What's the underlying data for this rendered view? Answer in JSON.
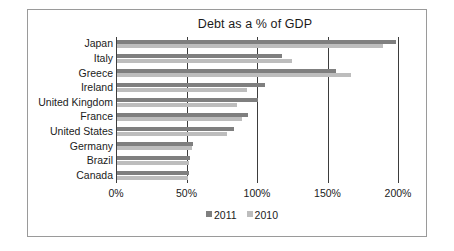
{
  "chart_data": {
    "type": "bar",
    "orientation": "horizontal",
    "title": "Debt as a % of GDP",
    "xlabel": "",
    "ylabel": "",
    "xlim": [
      0,
      200
    ],
    "xticks": [
      0,
      50,
      100,
      150,
      200
    ],
    "xtick_labels": [
      "0%",
      "50%",
      "100%",
      "150%",
      "200%"
    ],
    "grid": true,
    "legend_position": "bottom",
    "categories": [
      "Japan",
      "Italy",
      "Greece",
      "Ireland",
      "United Kingdom",
      "France",
      "United States",
      "Germany",
      "Brazil",
      "Canada"
    ],
    "series": [
      {
        "name": "2011",
        "color": "#7f7f7f",
        "values": [
          198,
          117,
          155,
          105,
          100,
          93,
          83,
          54,
          52,
          51
        ]
      },
      {
        "name": "2010",
        "color": "#bdbdbd",
        "values": [
          189,
          124,
          166,
          92,
          85,
          89,
          78,
          53,
          51,
          50
        ]
      }
    ]
  },
  "legend": {
    "entries": [
      {
        "label": "2011",
        "color": "#7f7f7f"
      },
      {
        "label": "2010",
        "color": "#bdbdbd"
      }
    ]
  },
  "colors": {
    "series_2011": "#7f7f7f",
    "series_2010": "#bdbdbd",
    "axis": "#3d3d3d",
    "border": "#9a9a9a",
    "text": "#1b1b1b"
  }
}
